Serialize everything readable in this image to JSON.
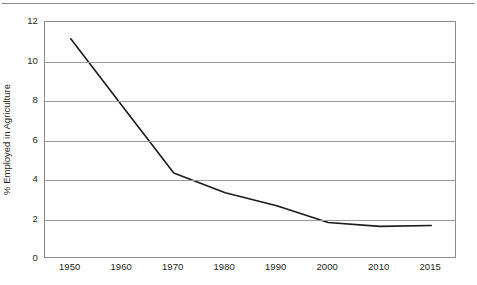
{
  "chart_data": {
    "type": "line",
    "title": "",
    "xlabel": "",
    "ylabel": "% Employed in Agriculture",
    "categories": [
      "1950",
      "1960",
      "1970",
      "1980",
      "1990",
      "2000",
      "2010",
      "2015"
    ],
    "x_tick_labels": [
      "1950",
      "1960",
      "1970",
      "1980",
      "1990",
      "2000",
      "2010",
      "2015"
    ],
    "y_tick_labels": [
      "12",
      "10",
      "8",
      "6",
      "4",
      "2",
      "0"
    ],
    "y_ticks": [
      12,
      10,
      8,
      6,
      4,
      2,
      0
    ],
    "ylim": [
      0,
      12
    ],
    "grid": "horizontal",
    "legend": "none",
    "series": [
      {
        "name": "% Employed in Agriculture",
        "color": "#1a1a1a",
        "values": [
          11.15,
          7.75,
          4.35,
          3.35,
          2.7,
          1.85,
          1.65,
          1.7
        ]
      }
    ],
    "points": [
      {
        "x": "1950",
        "y": 11.15
      },
      {
        "x": "1960",
        "y": 7.75
      },
      {
        "x": "1970",
        "y": 4.35
      },
      {
        "x": "1980",
        "y": 3.35
      },
      {
        "x": "1990",
        "y": 2.7
      },
      {
        "x": "2000",
        "y": 1.85
      },
      {
        "x": "2010",
        "y": 1.65
      },
      {
        "x": "2015",
        "y": 1.7
      }
    ],
    "annotations": []
  },
  "colors": {
    "line": "#1a1a1a",
    "grid": "#9a9a9a",
    "frame": "#8c8c8c",
    "rule": "#8a8a8a",
    "text": "#231f20",
    "background": "#ffffff"
  }
}
